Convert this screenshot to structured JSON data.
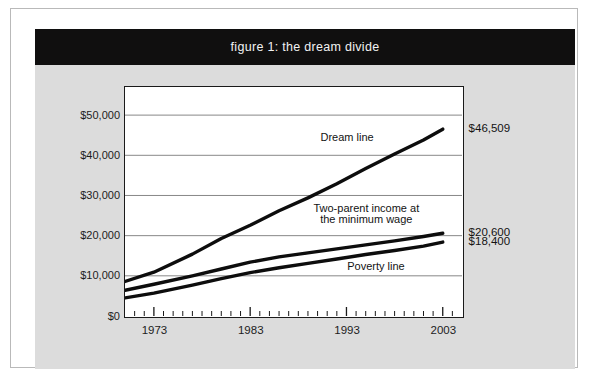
{
  "figure": {
    "title": "figure 1: the dream divide",
    "banner_bg": "#100f0f",
    "banner_fg": "#f2f2f2",
    "panel_bg": "#dcdcdc",
    "plot_bg": "#ffffff",
    "ink": "#131313"
  },
  "chart_data": {
    "type": "line",
    "title": "figure 1: the dream divide",
    "xlabel": "",
    "ylabel": "",
    "xlim": [
      1970,
      2005
    ],
    "ylim": [
      0,
      57000
    ],
    "grid": true,
    "grid_axis": "y",
    "legend_position": "inline-annotations",
    "ytick_labels": [
      "$0",
      "$10,000",
      "$20,000",
      "$30,000",
      "$40,000",
      "$50,000"
    ],
    "ytick_values": [
      0,
      10000,
      20000,
      30000,
      40000,
      50000
    ],
    "xtick_labels": [
      "1973",
      "1983",
      "1993",
      "2003"
    ],
    "xtick_values": [
      1973,
      1983,
      1993,
      2003
    ],
    "x_minor_tick_step": 1,
    "series": [
      {
        "name": "Dream line",
        "annotation": "Dream line",
        "end_label": "$46,509",
        "x": [
          1970,
          1973,
          1977,
          1980,
          1983,
          1986,
          1989,
          1992,
          1995,
          1998,
          2001,
          2003
        ],
        "values": [
          8600,
          10900,
          15400,
          19300,
          22600,
          26200,
          29400,
          32900,
          36700,
          40300,
          43800,
          46509
        ]
      },
      {
        "name": "Two-parent income at the minimum wage",
        "annotation": "Two-parent income at\nthe minimum wage",
        "annotation_line_1": "Two-parent income at",
        "annotation_line_2": "the minimum wage",
        "end_label": "$20,600",
        "x": [
          1970,
          1973,
          1977,
          1980,
          1983,
          1986,
          1989,
          1992,
          1995,
          1998,
          2001,
          2003
        ],
        "values": [
          6400,
          7900,
          10000,
          11700,
          13400,
          14700,
          15700,
          16700,
          17700,
          18700,
          19800,
          20600
        ]
      },
      {
        "name": "Poverty line",
        "annotation": "Poverty line",
        "end_label": "$18,400",
        "x": [
          1970,
          1973,
          1977,
          1980,
          1983,
          1986,
          1989,
          1992,
          1995,
          1998,
          2001,
          2003
        ],
        "values": [
          4500,
          5700,
          7700,
          9300,
          10800,
          12000,
          13100,
          14200,
          15300,
          16300,
          17400,
          18400
        ]
      }
    ],
    "annotations": [
      {
        "text": "Dream line",
        "x": 1993,
        "y": 44500
      },
      {
        "text": "Two-parent income at",
        "x": 1995,
        "y": 26800
      },
      {
        "text": "the minimum wage",
        "x": 1995,
        "y": 24000
      },
      {
        "text": "Poverty line",
        "x": 1996,
        "y": 12300
      }
    ],
    "end_labels": [
      {
        "text": "$46,509",
        "value": 46509,
        "series": "Dream line"
      },
      {
        "text": "$20,600",
        "value": 20600,
        "series": "Two-parent income at the minimum wage"
      },
      {
        "text": "$18,400",
        "value": 18400,
        "series": "Poverty line"
      }
    ]
  }
}
